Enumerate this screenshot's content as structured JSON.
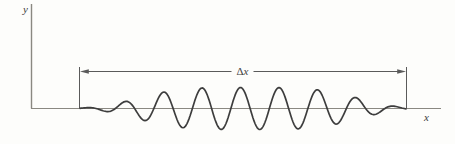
{
  "figure": {
    "background_color": "#fdfdfb",
    "axis_color": "#8a8881",
    "annotation_color": "#5a5a5a",
    "wave_color": "#3d3d3d",
    "labels": {
      "y_axis": "y",
      "x_axis": "x",
      "span_delta": "Δ",
      "span_variable": "x"
    },
    "wave": {
      "x_start": 80,
      "x_end": 406,
      "baseline_y": 108.5,
      "wavelength": 38.5,
      "carrier_peak_x": 240.5,
      "amplitude": 21,
      "envelope_center": 248,
      "envelope_width": 120,
      "envelope_power": 4
    }
  }
}
